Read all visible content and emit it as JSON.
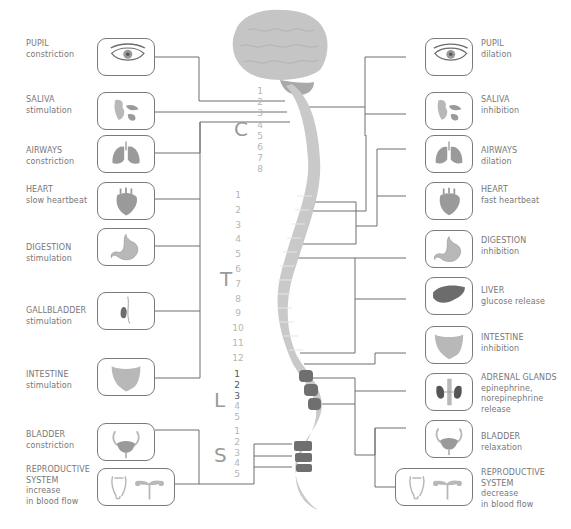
{
  "diagram": {
    "left_side": [
      {
        "id": "pupil",
        "title": "PUPIL",
        "lines": [
          "constriction"
        ],
        "icon": "eye-icon"
      },
      {
        "id": "saliva",
        "title": "SALIVA",
        "lines": [
          "stimulation"
        ],
        "icon": "salivary-glands-icon"
      },
      {
        "id": "airways",
        "title": "AIRWAYS",
        "lines": [
          "constriction"
        ],
        "icon": "lungs-icon"
      },
      {
        "id": "heart",
        "title": "HEART",
        "lines": [
          "slow heartbeat"
        ],
        "icon": "heart-icon"
      },
      {
        "id": "digestion",
        "title": "DIGESTION",
        "lines": [
          "stimulation"
        ],
        "icon": "stomach-icon"
      },
      {
        "id": "gallbladder",
        "title": "GALLBLADDER",
        "lines": [
          "stimulation"
        ],
        "icon": "gallbladder-icon"
      },
      {
        "id": "intestine",
        "title": "INTESTINE",
        "lines": [
          "stimulation"
        ],
        "icon": "intestine-icon"
      },
      {
        "id": "bladder",
        "title": "BLADDER",
        "lines": [
          "constriction"
        ],
        "icon": "bladder-icon"
      },
      {
        "id": "reproductive",
        "title": "REPRODUCTIVE",
        "lines": [
          "SYSTEM",
          "increase",
          "in blood flow"
        ],
        "icon": "reproductive-organs-icon"
      }
    ],
    "right_side": [
      {
        "id": "pupil",
        "title": "PUPIL",
        "lines": [
          "dilation"
        ],
        "icon": "eye-icon"
      },
      {
        "id": "saliva",
        "title": "SALIVA",
        "lines": [
          "inhibition"
        ],
        "icon": "salivary-glands-icon"
      },
      {
        "id": "airways",
        "title": "AIRWAYS",
        "lines": [
          "dilation"
        ],
        "icon": "lungs-icon"
      },
      {
        "id": "heart",
        "title": "HEART",
        "lines": [
          "fast heartbeat"
        ],
        "icon": "heart-icon"
      },
      {
        "id": "digestion",
        "title": "DIGESTION",
        "lines": [
          "inhibition"
        ],
        "icon": "stomach-icon"
      },
      {
        "id": "liver",
        "title": "LIVER",
        "lines": [
          "glucose release"
        ],
        "icon": "liver-icon"
      },
      {
        "id": "intestine",
        "title": "INTESTINE",
        "lines": [
          "inhibition"
        ],
        "icon": "intestine-icon"
      },
      {
        "id": "adrenal",
        "title": "ADRENAL GLANDS",
        "lines": [
          "epinephrine,",
          "norepinephrine",
          "release"
        ],
        "icon": "kidneys-adrenal-icon"
      },
      {
        "id": "bladder",
        "title": "BLADDER",
        "lines": [
          "relaxation"
        ],
        "icon": "bladder-icon"
      },
      {
        "id": "reproductive",
        "title": "REPRODUCTIVE",
        "lines": [
          "SYSTEM",
          "decrease",
          "in blood flow"
        ],
        "icon": "reproductive-organs-icon"
      }
    ],
    "spine_regions": [
      {
        "letter": "C",
        "numbers": [
          "1",
          "2",
          "3",
          "4",
          "5",
          "6",
          "7",
          "8"
        ]
      },
      {
        "letter": "T",
        "numbers": [
          "1",
          "2",
          "3",
          "4",
          "5",
          "6",
          "7",
          "8",
          "9",
          "10",
          "11",
          "12"
        ]
      },
      {
        "letter": "L",
        "numbers": [
          "1",
          "2",
          "3",
          "4",
          "5"
        ]
      },
      {
        "letter": "S",
        "numbers": [
          "1",
          "2",
          "3",
          "4",
          "5"
        ]
      }
    ],
    "colors": {
      "line": "#6e6e6e",
      "text": "#777777",
      "spine": "#c9c9c9",
      "spine_dark": "#6f6f6f",
      "brain": "#c4c4c4",
      "number": "#b5b5b5"
    }
  }
}
